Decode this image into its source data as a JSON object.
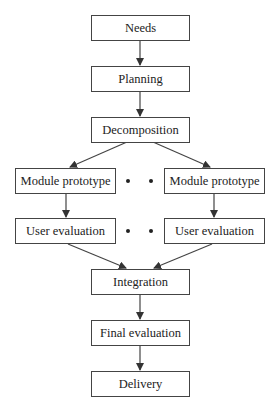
{
  "diagram": {
    "type": "flowchart",
    "nodes": {
      "needs": "Needs",
      "planning": "Planning",
      "decomposition": "Decomposition",
      "module_prototype_left": "Module prototype",
      "module_prototype_right": "Module prototype",
      "user_evaluation_left": "User evaluation",
      "user_evaluation_right": "User evaluation",
      "integration": "Integration",
      "final_evaluation": "Final evaluation",
      "delivery": "Delivery"
    },
    "edges": [
      [
        "Needs",
        "Planning"
      ],
      [
        "Planning",
        "Decomposition"
      ],
      [
        "Decomposition",
        "Module prototype (left)"
      ],
      [
        "Decomposition",
        "Module prototype (right)"
      ],
      [
        "Module prototype (left)",
        "User evaluation (left)"
      ],
      [
        "Module prototype (right)",
        "User evaluation (right)"
      ],
      [
        "User evaluation (left)",
        "Integration"
      ],
      [
        "User evaluation (right)",
        "Integration"
      ],
      [
        "Integration",
        "Final evaluation"
      ],
      [
        "Final evaluation",
        "Delivery"
      ]
    ],
    "ellipsis_between_parallel_branches": true,
    "colors": {
      "line": "#444444",
      "background": "#ffffff",
      "text": "#222222"
    }
  }
}
